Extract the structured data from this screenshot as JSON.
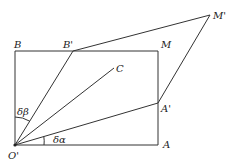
{
  "diagram": {
    "title": "",
    "points": {
      "O": {
        "label": "O'",
        "x": 15,
        "y": 145
      },
      "A": {
        "label": "A",
        "x": 158,
        "y": 145
      },
      "M": {
        "label": "M",
        "x": 158,
        "y": 51
      },
      "B": {
        "label": "B",
        "x": 15,
        "y": 51
      },
      "Bp": {
        "label": "B'",
        "x": 73,
        "y": 51
      },
      "Ap": {
        "label": "A'",
        "x": 158,
        "y": 103
      },
      "Mp": {
        "label": "M'",
        "x": 210,
        "y": 15
      },
      "C": {
        "label": "C",
        "x": 114,
        "y": 68
      }
    },
    "angles": {
      "alpha": "δα",
      "beta": "δβ"
    },
    "segments": [
      [
        "O",
        "A"
      ],
      [
        "A",
        "M"
      ],
      [
        "M",
        "B"
      ],
      [
        "B",
        "O"
      ],
      [
        "O",
        "Bp"
      ],
      [
        "O",
        "Ap"
      ],
      [
        "O",
        "C"
      ],
      [
        "Bp",
        "Mp"
      ],
      [
        "Ap",
        "Mp"
      ]
    ],
    "stroke_color": "#333333"
  }
}
